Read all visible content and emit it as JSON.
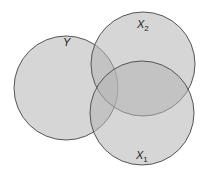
{
  "diagram": {
    "type": "venn",
    "circles": [
      {
        "id": "Y",
        "label": "Y",
        "sub": "",
        "cx": 66,
        "cy": 88,
        "r": 52,
        "label_x": 63,
        "label_y": 46
      },
      {
        "id": "X2",
        "label": "X",
        "sub": "2",
        "cx": 143,
        "cy": 64,
        "r": 52,
        "label_x": 137,
        "label_y": 28
      },
      {
        "id": "X1",
        "label": "X",
        "sub": "1",
        "cx": 142,
        "cy": 113,
        "r": 52,
        "label_x": 136,
        "label_y": 159
      }
    ],
    "fill": "#b5b5b5",
    "fill_opacity": 0.55,
    "stroke": "#555555"
  }
}
